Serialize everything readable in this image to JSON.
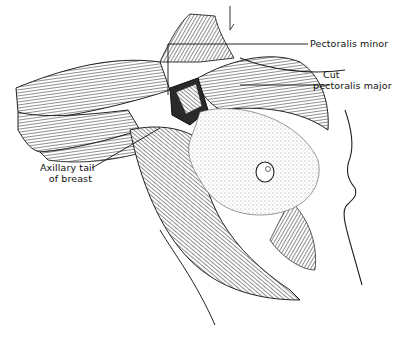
{
  "figure": {
    "labels": [
      {
        "id": "pectoralis-minor",
        "text": "Pectoralis minor"
      },
      {
        "id": "cut-pectoralis-major-line1",
        "text": "Cut"
      },
      {
        "id": "cut-pectoralis-major-line2",
        "text": "pectoralis major"
      },
      {
        "id": "axillary-tail-line1",
        "text": "Axillary tail"
      },
      {
        "id": "axillary-tail-line2",
        "text": "of breast"
      }
    ]
  }
}
